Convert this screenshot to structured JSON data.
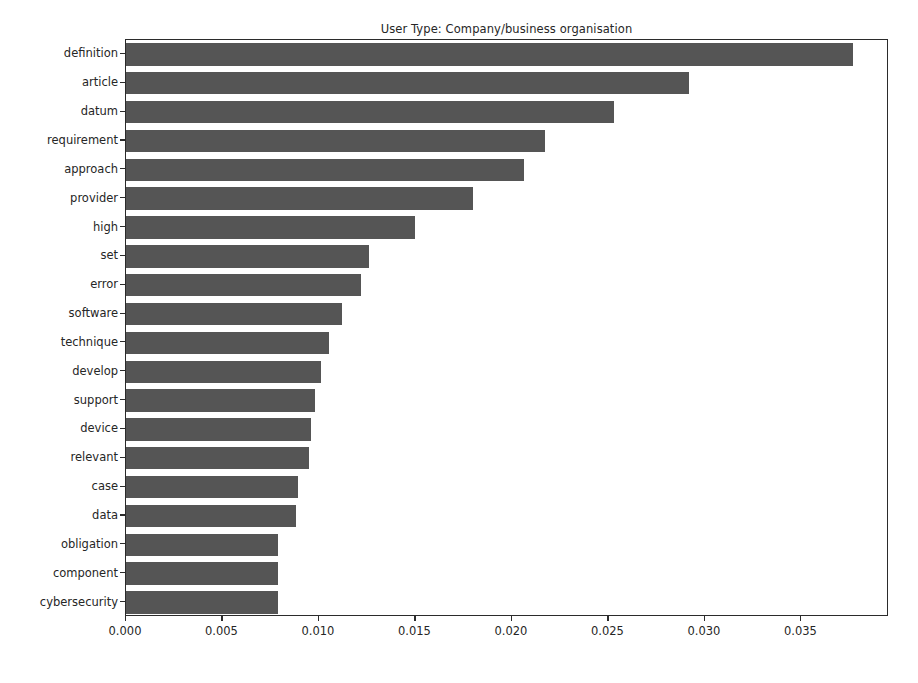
{
  "chart_data": {
    "type": "bar",
    "orientation": "horizontal",
    "title": "User Type: Company/business organisation",
    "xlabel": "",
    "ylabel": "",
    "grid": false,
    "legend": null,
    "xlim": [
      0.0,
      0.03954
    ],
    "xticks": [
      0.0,
      0.005,
      0.01,
      0.015,
      0.02,
      0.025,
      0.03,
      0.035
    ],
    "xtick_labels": [
      "0.000",
      "0.005",
      "0.010",
      "0.015",
      "0.020",
      "0.025",
      "0.030",
      "0.035"
    ],
    "bar_color": "#555555",
    "categories": [
      "definition",
      "article",
      "datum",
      "requirement",
      "approach",
      "provider",
      "high",
      "set",
      "error",
      "software",
      "technique",
      "develop",
      "support",
      "device",
      "relevant",
      "case",
      "data",
      "obligation",
      "component",
      "cybersecurity"
    ],
    "values": [
      0.0377,
      0.0292,
      0.0253,
      0.0217,
      0.0206,
      0.018,
      0.015,
      0.0126,
      0.0122,
      0.0112,
      0.0105,
      0.0101,
      0.0098,
      0.0096,
      0.0095,
      0.0089,
      0.0088,
      0.0079,
      0.0079,
      0.0079
    ]
  }
}
